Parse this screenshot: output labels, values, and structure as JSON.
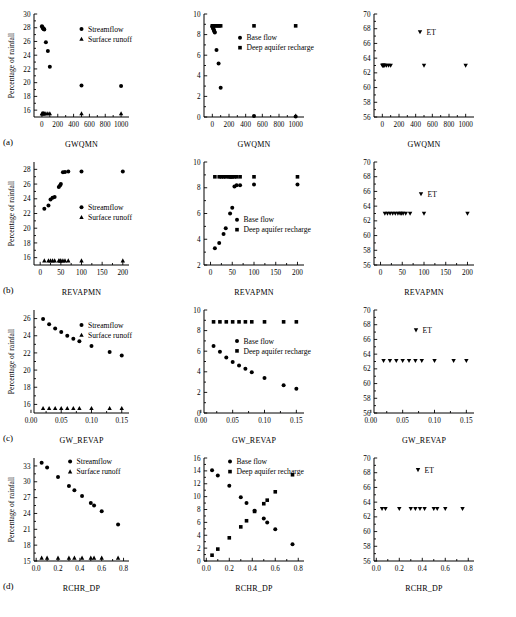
{
  "figure": {
    "panel_labels": [
      "(a)",
      "(b)",
      "(c)",
      "(d)"
    ],
    "ylabel": "Percentage of rainfall",
    "legend": {
      "streamflow": "Streamflow",
      "surface_runoff": "Surface runoff",
      "base_flow": "Base flow",
      "deep_aquifer_recharge": "Deep aquifer recharge",
      "et": "ET"
    },
    "marker_colors": {
      "ink": "#000000",
      "background": "#ffffff"
    }
  },
  "chart_data": [
    {
      "id": "a-left",
      "type": "scatter",
      "title": "",
      "xlabel": "GWQMN",
      "ylabel": "Percentage of rainfall",
      "xlim": [
        -100,
        1100
      ],
      "ylim": [
        15,
        30
      ],
      "xticks": [
        0,
        200,
        400,
        600,
        800,
        1000
      ],
      "yticks": [
        16,
        18,
        20,
        22,
        24,
        26,
        28,
        30
      ],
      "grid": false,
      "legend_position": "upper-right",
      "series": [
        {
          "name": "Streamflow",
          "marker": "circle",
          "x": [
            0,
            5,
            10,
            15,
            20,
            25,
            30,
            50,
            75,
            100,
            500,
            1000
          ],
          "y": [
            28.2,
            28.1,
            28.0,
            27.9,
            27.85,
            27.8,
            27.75,
            25.9,
            24.6,
            22.3,
            19.6,
            19.5
          ]
        },
        {
          "name": "Surface runoff",
          "marker": "triangle-up",
          "x": [
            0,
            5,
            10,
            15,
            20,
            25,
            30,
            50,
            75,
            100,
            500,
            1000
          ],
          "y": [
            15.5,
            15.5,
            15.5,
            15.5,
            15.5,
            15.5,
            15.5,
            15.5,
            15.5,
            15.5,
            15.5,
            15.5
          ]
        }
      ]
    },
    {
      "id": "a-mid",
      "type": "scatter",
      "xlabel": "GWQMN",
      "ylabel": "",
      "xlim": [
        -100,
        1100
      ],
      "ylim": [
        0,
        10
      ],
      "xticks": [
        0,
        200,
        400,
        600,
        800,
        1000
      ],
      "yticks": [
        0,
        2,
        4,
        6,
        8,
        10
      ],
      "grid": false,
      "legend_position": "center",
      "series": [
        {
          "name": "Base flow",
          "marker": "circle",
          "x": [
            0,
            5,
            10,
            15,
            20,
            25,
            30,
            50,
            75,
            100,
            500,
            1000
          ],
          "y": [
            8.8,
            8.7,
            8.6,
            8.5,
            8.4,
            8.3,
            8.2,
            6.5,
            5.2,
            2.85,
            0.1,
            0.05
          ]
        },
        {
          "name": "Deep aquifer recharge",
          "marker": "square",
          "x": [
            0,
            10,
            20,
            40,
            60,
            80,
            100,
            500,
            1000
          ],
          "y": [
            8.85,
            8.85,
            8.85,
            8.85,
            8.85,
            8.85,
            8.85,
            8.85,
            8.85
          ]
        }
      ]
    },
    {
      "id": "a-right",
      "type": "scatter",
      "xlabel": "GWQMN",
      "ylabel": "",
      "xlim": [
        -100,
        1100
      ],
      "ylim": [
        56,
        70
      ],
      "xticks": [
        0,
        200,
        400,
        600,
        800,
        1000
      ],
      "yticks": [
        56,
        58,
        60,
        62,
        64,
        66,
        68,
        70
      ],
      "grid": false,
      "legend_position": "upper-center",
      "series": [
        {
          "name": "ET",
          "marker": "triangle-down",
          "x": [
            0,
            5,
            10,
            15,
            20,
            30,
            50,
            75,
            100,
            500,
            1000
          ],
          "y": [
            63.0,
            63.0,
            63.0,
            63.0,
            63.0,
            63.0,
            63.0,
            63.0,
            63.0,
            63.0,
            63.0
          ]
        }
      ]
    },
    {
      "id": "b-left",
      "type": "scatter",
      "xlabel": "REVAPMN",
      "ylabel": "Percentage of rainfall",
      "xlim": [
        -15,
        215
      ],
      "ylim": [
        15,
        29
      ],
      "xticks": [
        0,
        50,
        100,
        150,
        200
      ],
      "yticks": [
        16,
        18,
        20,
        22,
        24,
        26,
        28
      ],
      "grid": false,
      "legend_position": "center-right",
      "series": [
        {
          "name": "Streamflow",
          "marker": "circle",
          "x": [
            10,
            20,
            25,
            30,
            35,
            45,
            48,
            50,
            55,
            60,
            68,
            100,
            200
          ],
          "y": [
            22.65,
            23.1,
            23.9,
            24.15,
            24.25,
            25.6,
            25.8,
            26.0,
            27.6,
            27.65,
            27.7,
            27.7,
            27.7
          ]
        },
        {
          "name": "Surface runoff",
          "marker": "triangle-up",
          "x": [
            10,
            20,
            25,
            30,
            35,
            45,
            48,
            50,
            55,
            60,
            68,
            100,
            200
          ],
          "y": [
            15.6,
            15.6,
            15.6,
            15.6,
            15.6,
            15.6,
            15.6,
            15.6,
            15.6,
            15.6,
            15.6,
            15.6,
            15.6
          ]
        }
      ]
    },
    {
      "id": "b-mid",
      "type": "scatter",
      "xlabel": "REVAPMN",
      "ylabel": "",
      "xlim": [
        -15,
        215
      ],
      "ylim": [
        2,
        10
      ],
      "xticks": [
        0,
        50,
        100,
        150,
        200
      ],
      "yticks": [
        2,
        4,
        6,
        8,
        10
      ],
      "grid": false,
      "legend_position": "center",
      "series": [
        {
          "name": "Base flow",
          "marker": "circle",
          "x": [
            10,
            20,
            30,
            35,
            45,
            50,
            55,
            60,
            68,
            100,
            200
          ],
          "y": [
            3.3,
            3.7,
            4.4,
            4.85,
            6.0,
            6.45,
            8.1,
            8.2,
            8.2,
            8.25,
            8.25
          ]
        },
        {
          "name": "Deep aquifer recharge",
          "marker": "square",
          "x": [
            10,
            20,
            25,
            30,
            35,
            42,
            45,
            48,
            50,
            55,
            60,
            68,
            100,
            200
          ],
          "y": [
            8.85,
            8.85,
            8.85,
            8.85,
            8.85,
            8.85,
            8.85,
            8.85,
            8.85,
            8.85,
            8.85,
            8.85,
            8.85,
            8.85
          ]
        }
      ]
    },
    {
      "id": "b-right",
      "type": "scatter",
      "xlabel": "REVAPMN",
      "ylabel": "",
      "xlim": [
        -15,
        215
      ],
      "ylim": [
        56,
        70
      ],
      "xticks": [
        0,
        50,
        100,
        150,
        200
      ],
      "yticks": [
        56,
        58,
        60,
        62,
        64,
        66,
        68,
        70
      ],
      "grid": false,
      "legend_position": "upper-center",
      "series": [
        {
          "name": "ET",
          "marker": "triangle-down",
          "x": [
            10,
            16,
            22,
            28,
            34,
            40,
            45,
            48,
            52,
            58,
            68,
            100,
            200
          ],
          "y": [
            63.0,
            63.0,
            63.0,
            63.0,
            63.0,
            63.0,
            63.0,
            63.0,
            63.0,
            63.0,
            63.0,
            63.0,
            63.0
          ]
        }
      ]
    },
    {
      "id": "c-left",
      "type": "scatter",
      "xlabel": "GW_REVAP",
      "ylabel": "Percentage of rainfall",
      "xlim": [
        0.005,
        0.162
      ],
      "ylim": [
        15,
        27
      ],
      "xticks": [
        0.0,
        0.05,
        0.1,
        0.15
      ],
      "xticklabels": [
        "0.00",
        "0.05",
        "0.10",
        "0.15"
      ],
      "yticks": [
        16,
        18,
        20,
        22,
        24,
        26
      ],
      "grid": false,
      "legend_position": "upper-right",
      "series": [
        {
          "name": "Streamflow",
          "marker": "circle",
          "x": [
            0.02,
            0.03,
            0.04,
            0.05,
            0.06,
            0.07,
            0.08,
            0.1,
            0.13,
            0.15
          ],
          "y": [
            25.95,
            25.35,
            24.85,
            24.45,
            24.0,
            23.65,
            23.35,
            22.8,
            22.1,
            21.7
          ]
        },
        {
          "name": "Surface runoff",
          "marker": "triangle-up",
          "x": [
            0.02,
            0.03,
            0.04,
            0.05,
            0.06,
            0.07,
            0.08,
            0.1,
            0.13,
            0.15
          ],
          "y": [
            15.55,
            15.55,
            15.55,
            15.55,
            15.55,
            15.55,
            15.55,
            15.55,
            15.55,
            15.55
          ]
        }
      ]
    },
    {
      "id": "c-mid",
      "type": "scatter",
      "xlabel": "GW_REVAP",
      "ylabel": "",
      "xlim": [
        0.005,
        0.162
      ],
      "ylim": [
        0,
        10
      ],
      "xticks": [
        0.0,
        0.05,
        0.1,
        0.15
      ],
      "xticklabels": [
        "0.00",
        "0.05",
        "0.10",
        "0.15"
      ],
      "yticks": [
        0,
        2,
        4,
        6,
        8,
        10
      ],
      "grid": false,
      "legend_position": "center",
      "series": [
        {
          "name": "Base flow",
          "marker": "circle",
          "x": [
            0.02,
            0.03,
            0.04,
            0.05,
            0.06,
            0.07,
            0.08,
            0.1,
            0.13,
            0.15
          ],
          "y": [
            6.5,
            5.95,
            5.4,
            4.95,
            4.6,
            4.3,
            3.95,
            3.4,
            2.7,
            2.35
          ]
        },
        {
          "name": "Deep aquifer recharge",
          "marker": "square",
          "x": [
            0.02,
            0.03,
            0.04,
            0.05,
            0.06,
            0.07,
            0.08,
            0.1,
            0.13,
            0.15
          ],
          "y": [
            8.85,
            8.85,
            8.85,
            8.85,
            8.85,
            8.85,
            8.85,
            8.85,
            8.85,
            8.85
          ]
        }
      ]
    },
    {
      "id": "c-right",
      "type": "scatter",
      "xlabel": "GW_REVAP",
      "ylabel": "",
      "xlim": [
        0.005,
        0.162
      ],
      "ylim": [
        56,
        70
      ],
      "xticks": [
        0.0,
        0.05,
        0.1,
        0.15
      ],
      "xticklabels": [
        "0.00",
        "0.05",
        "0.10",
        "0.15"
      ],
      "yticks": [
        56,
        58,
        60,
        62,
        64,
        66,
        68,
        70
      ],
      "grid": false,
      "legend_position": "upper-center",
      "series": [
        {
          "name": "ET",
          "marker": "triangle-down",
          "x": [
            0.02,
            0.03,
            0.04,
            0.05,
            0.06,
            0.07,
            0.08,
            0.1,
            0.13,
            0.15
          ],
          "y": [
            63.1,
            63.1,
            63.1,
            63.1,
            63.1,
            63.1,
            63.1,
            63.1,
            63.1,
            63.1
          ]
        }
      ]
    },
    {
      "id": "d-left",
      "type": "scatter",
      "xlabel": "RCHR_DP",
      "ylabel": "Percentage of rainfall",
      "xlim": [
        -0.02,
        0.85
      ],
      "ylim": [
        15,
        34.5
      ],
      "xticks": [
        0.0,
        0.2,
        0.4,
        0.6,
        0.8
      ],
      "xticklabels": [
        "0.0",
        "0.2",
        "0.4",
        "0.6",
        "0.8"
      ],
      "yticks": [
        15,
        18,
        21,
        24,
        27,
        30,
        33
      ],
      "grid": false,
      "legend_position": "upper-right",
      "series": [
        {
          "name": "Streamflow",
          "marker": "circle",
          "x": [
            0.05,
            0.1,
            0.2,
            0.3,
            0.35,
            0.42,
            0.5,
            0.53,
            0.6,
            0.75
          ],
          "y": [
            33.6,
            32.7,
            30.9,
            29.2,
            28.4,
            27.3,
            26.0,
            25.5,
            24.4,
            21.9
          ]
        },
        {
          "name": "Surface runoff",
          "marker": "triangle-up",
          "x": [
            0.05,
            0.1,
            0.2,
            0.3,
            0.35,
            0.42,
            0.5,
            0.53,
            0.6,
            0.75
          ],
          "y": [
            15.6,
            15.6,
            15.6,
            15.6,
            15.6,
            15.6,
            15.6,
            15.6,
            15.6,
            15.6
          ]
        }
      ]
    },
    {
      "id": "d-mid",
      "type": "scatter",
      "xlabel": "RCHR_DP",
      "ylabel": "",
      "xlim": [
        -0.02,
        0.85
      ],
      "ylim": [
        0,
        16
      ],
      "xticks": [
        0.0,
        0.2,
        0.4,
        0.6,
        0.8
      ],
      "xticklabels": [
        "0.0",
        "0.2",
        "0.4",
        "0.6",
        "0.8"
      ],
      "yticks": [
        0,
        2,
        4,
        6,
        8,
        10,
        12,
        14,
        16
      ],
      "grid": false,
      "legend_position": "upper-center",
      "series": [
        {
          "name": "Base flow",
          "marker": "circle",
          "x": [
            0.05,
            0.1,
            0.2,
            0.3,
            0.35,
            0.42,
            0.5,
            0.53,
            0.6,
            0.75
          ],
          "y": [
            14.1,
            13.3,
            11.7,
            9.9,
            9.0,
            7.8,
            6.6,
            6.0,
            4.95,
            2.6
          ]
        },
        {
          "name": "Deep aquifer recharge",
          "marker": "square",
          "x": [
            0.05,
            0.1,
            0.2,
            0.3,
            0.35,
            0.42,
            0.5,
            0.53,
            0.6,
            0.75
          ],
          "y": [
            0.9,
            1.85,
            3.6,
            5.3,
            6.25,
            7.7,
            8.9,
            9.45,
            10.75,
            13.4
          ]
        }
      ]
    },
    {
      "id": "d-right",
      "type": "scatter",
      "xlabel": "RCHR_DP",
      "ylabel": "",
      "xlim": [
        -0.02,
        0.85
      ],
      "ylim": [
        56,
        70
      ],
      "xticks": [
        0.0,
        0.2,
        0.4,
        0.6,
        0.8
      ],
      "xticklabels": [
        "0.0",
        "0.2",
        "0.4",
        "0.6",
        "0.8"
      ],
      "yticks": [
        56,
        58,
        60,
        62,
        64,
        66,
        68,
        70
      ],
      "grid": false,
      "legend_position": "upper-center",
      "series": [
        {
          "name": "ET",
          "marker": "triangle-down",
          "x": [
            0.05,
            0.08,
            0.2,
            0.3,
            0.34,
            0.38,
            0.42,
            0.5,
            0.53,
            0.6,
            0.75
          ],
          "y": [
            63.1,
            63.1,
            63.1,
            63.1,
            63.1,
            63.1,
            63.1,
            63.1,
            63.1,
            63.1,
            63.1
          ]
        }
      ]
    }
  ]
}
